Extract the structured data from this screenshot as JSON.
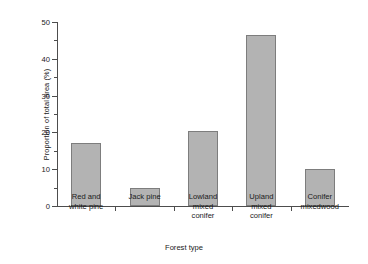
{
  "chart_data": {
    "type": "bar",
    "title": "",
    "xlabel": "Forest type",
    "ylabel": "Proportion of total area (%)",
    "categories": [
      "Red and\nwhite pine",
      "Jack pine",
      "Lowland\nmixed\nconifer",
      "Upland\nmixed\nconifer",
      "Conifer\nmixedwood"
    ],
    "values": [
      17,
      5,
      20.3,
      46.5,
      10
    ],
    "ylim": [
      0,
      50
    ],
    "yticks": [
      0,
      10,
      20,
      30,
      40,
      50
    ],
    "ytick_labels": [
      "0",
      "10",
      "20",
      "30",
      "40",
      "50"
    ],
    "yminor_ticks": [
      5,
      15,
      25,
      35,
      45
    ],
    "grid": false,
    "legend": "none",
    "bar_color": "#b3b3b3",
    "bar_edge_color": "#7d7d7d",
    "axis_color": "#4d4d4d"
  }
}
